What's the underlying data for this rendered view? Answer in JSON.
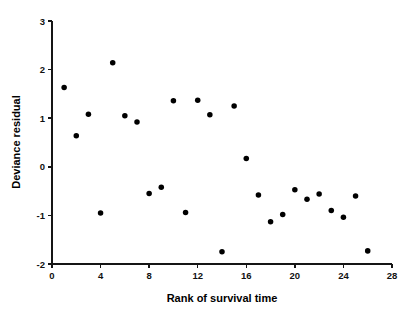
{
  "chart_data": {
    "type": "scatter",
    "title": "",
    "subtitle": "",
    "xlabel": "Rank of survival time",
    "ylabel": "Deviance residual",
    "xlim": [
      0,
      28
    ],
    "ylim": [
      -2,
      3
    ],
    "xticks": [
      0,
      4,
      8,
      12,
      16,
      20,
      24,
      28
    ],
    "xticklabels": [
      "0",
      "4",
      "8",
      "12",
      "16",
      "20",
      "24",
      "28"
    ],
    "yticks": [
      -2,
      -1,
      0,
      1,
      2,
      3
    ],
    "yticklabels": [
      "-2",
      "-1",
      "0",
      "1",
      "2",
      "3"
    ],
    "grid": false,
    "legend": null,
    "marker": "filled-circle",
    "marker_color": "#000000",
    "marker_size": 4,
    "x": [
      1,
      2,
      3,
      4,
      5,
      6,
      7,
      8,
      9,
      10,
      11,
      12,
      13,
      14,
      15,
      16,
      17,
      18,
      19,
      20,
      21,
      22,
      23,
      24,
      25,
      26
    ],
    "y": [
      1.63,
      0.64,
      1.08,
      -0.95,
      2.14,
      1.05,
      0.92,
      -0.55,
      -0.42,
      1.36,
      -0.94,
      1.37,
      1.07,
      -1.75,
      1.25,
      0.17,
      -0.58,
      -1.13,
      -0.98,
      -0.47,
      -0.67,
      -0.56,
      -0.9,
      -1.04,
      -0.6,
      -1.73
    ],
    "points": [
      {
        "x": 1,
        "y": 1.63
      },
      {
        "x": 2,
        "y": 0.64
      },
      {
        "x": 3,
        "y": 1.08
      },
      {
        "x": 4,
        "y": -0.95
      },
      {
        "x": 5,
        "y": 2.14
      },
      {
        "x": 6,
        "y": 1.05
      },
      {
        "x": 7,
        "y": 0.92
      },
      {
        "x": 8,
        "y": -0.55
      },
      {
        "x": 9,
        "y": -0.42
      },
      {
        "x": 10,
        "y": 1.36
      },
      {
        "x": 11,
        "y": -0.94
      },
      {
        "x": 12,
        "y": 1.37
      },
      {
        "x": 13,
        "y": 1.07
      },
      {
        "x": 14,
        "y": -1.75
      },
      {
        "x": 15,
        "y": 1.25
      },
      {
        "x": 16,
        "y": 0.17
      },
      {
        "x": 17,
        "y": -0.58
      },
      {
        "x": 18,
        "y": -1.13
      },
      {
        "x": 19,
        "y": -0.98
      },
      {
        "x": 20,
        "y": -0.47
      },
      {
        "x": 21,
        "y": -0.67
      },
      {
        "x": 22,
        "y": -0.56
      },
      {
        "x": 23,
        "y": -0.9
      },
      {
        "x": 24,
        "y": -1.04
      },
      {
        "x": 25,
        "y": -0.6
      },
      {
        "x": 26,
        "y": -1.73
      }
    ]
  },
  "axes": {
    "x_title": "Rank of survival time",
    "y_title": "Deviance residual"
  },
  "colors": {
    "background": "#ffffff",
    "axis": "#151515",
    "marker": "#000000",
    "text": "#000000"
  }
}
